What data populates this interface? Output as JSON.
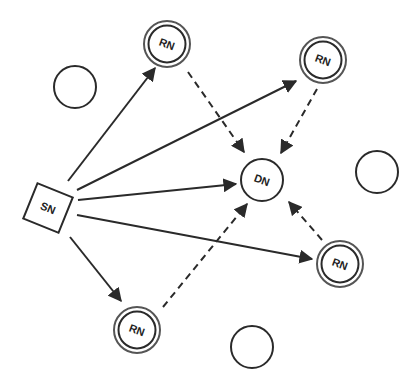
{
  "diagram": {
    "type": "relay network",
    "colors": {
      "stroke": "#2a2a2a",
      "relay_ring": "#555555",
      "background": "#ffffff"
    },
    "nodes": {
      "source": {
        "label": "SN",
        "shape": "square",
        "x": 48,
        "y": 208
      },
      "destination": {
        "label": "DN",
        "shape": "circle",
        "x": 262,
        "y": 180
      },
      "relays": [
        {
          "label": "RN",
          "x": 167,
          "y": 44
        },
        {
          "label": "RN",
          "x": 323,
          "y": 60
        },
        {
          "label": "RN",
          "x": 340,
          "y": 264
        },
        {
          "label": "RN",
          "x": 137,
          "y": 330
        }
      ],
      "idle": [
        {
          "x": 75,
          "y": 87
        },
        {
          "x": 377,
          "y": 172
        },
        {
          "x": 252,
          "y": 347
        }
      ]
    },
    "edges": {
      "solid_from_source": [
        "RN (top)",
        "RN (top-right)",
        "DN",
        "RN (right)",
        "RN (bottom)"
      ],
      "dashed_to_destination": [
        "RN (top)",
        "RN (top-right)",
        "RN (right)",
        "RN (bottom)"
      ]
    }
  }
}
